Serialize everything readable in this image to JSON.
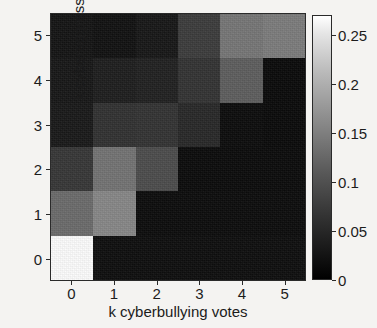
{
  "figure": {
    "title": "",
    "background_color": "#f4f3f1"
  },
  "axes": {
    "xlabel": "k cyberbullying votes",
    "ylabel": "k cyberaggression votes",
    "xticklabels": [
      "0",
      "1",
      "2",
      "3",
      "4",
      "5"
    ],
    "yticklabels": [
      "0",
      "1",
      "2",
      "3",
      "4",
      "5"
    ]
  },
  "colorbar": {
    "ticklabels": [
      "0",
      "0.05",
      "0.1",
      "0.15",
      "0.2",
      "0.25"
    ],
    "tickvalues": [
      0,
      0.05,
      0.1,
      0.15,
      0.2,
      0.25
    ],
    "vmin": 0,
    "vmax": 0.27,
    "colormap": "gray",
    "low_color": "#000000",
    "high_color": "#ffffff"
  },
  "chart_data": {
    "type": "heatmap",
    "title": "",
    "xlabel": "k cyberbullying votes",
    "ylabel": "k cyberaggression votes",
    "x": [
      0,
      1,
      2,
      3,
      4,
      5
    ],
    "y": [
      0,
      1,
      2,
      3,
      4,
      5
    ],
    "xticklabels": [
      "0",
      "1",
      "2",
      "3",
      "4",
      "5"
    ],
    "yticklabels": [
      "0",
      "1",
      "2",
      "3",
      "4",
      "5"
    ],
    "xlim": [
      -0.5,
      5.5
    ],
    "ylim": [
      -0.5,
      5.5
    ],
    "grid": false,
    "colormap": "gray",
    "vmin": 0,
    "vmax": 0.27,
    "colorbar": {
      "position": "right",
      "ticklabels": [
        "0",
        "0.05",
        "0.1",
        "0.15",
        "0.2",
        "0.25"
      ]
    },
    "row_order": "top_to_bottom_y5_to_y0",
    "rows": [
      {
        "y": 5,
        "values": [
          0.012,
          0.01,
          0.014,
          0.055,
          0.125,
          0.132
        ]
      },
      {
        "y": 4,
        "values": [
          0.014,
          0.02,
          0.022,
          0.042,
          0.095,
          0.004
        ]
      },
      {
        "y": 3,
        "values": [
          0.016,
          0.04,
          0.042,
          0.03,
          0.005,
          0.004
        ]
      },
      {
        "y": 2,
        "values": [
          0.048,
          0.12,
          0.07,
          0.004,
          0.004,
          0.004
        ]
      },
      {
        "y": 1,
        "values": [
          0.11,
          0.145,
          0.004,
          0.004,
          0.004,
          0.004
        ]
      },
      {
        "y": 0,
        "values": [
          0.27,
          0.006,
          0.006,
          0.006,
          0.006,
          0.006
        ]
      }
    ],
    "cell_colors": [
      [
        "#141414",
        "#111111",
        "#171717",
        "#3c3c3c",
        "#767676",
        "#7c7c7c"
      ],
      [
        "#171717",
        "#1e1e1e",
        "#212121",
        "#333333",
        "#5e5e5e",
        "#0a0a0a"
      ],
      [
        "#191919",
        "#313131",
        "#333333",
        "#282828",
        "#0c0c0c",
        "#0a0a0a"
      ],
      [
        "#373737",
        "#737373",
        "#4c4c4c",
        "#0b0b0b",
        "#0b0b0b",
        "#0b0b0b"
      ],
      [
        "#6b6b6b",
        "#878787",
        "#0c0c0c",
        "#0c0c0c",
        "#0c0c0c",
        "#0c0c0c"
      ],
      [
        "#fcfcfc",
        "#0e0e0e",
        "#0e0e0e",
        "#0e0e0e",
        "#0e0e0e",
        "#0e0e0e"
      ]
    ]
  }
}
